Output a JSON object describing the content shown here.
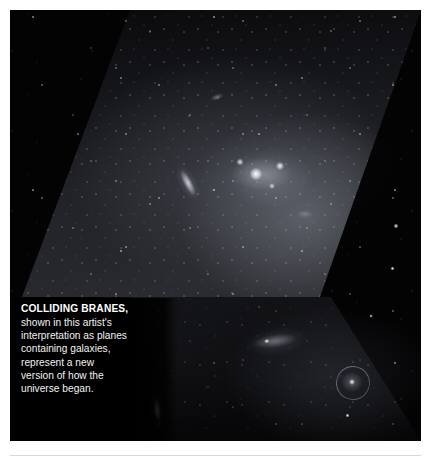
{
  "figure": {
    "alt_description": "Artist's rendering of two colliding branes depicted as star-filled planes containing galaxies",
    "background_color": "#000000",
    "page_background": "#ffffff",
    "caption": {
      "headline": "COLLIDING BRANES,",
      "body_lines": [
        "shown in this artist's",
        "interpretation as planes",
        "containing galaxies,",
        "represent a new",
        "version of how the",
        "universe began."
      ],
      "text_color": "#ffffff"
    },
    "objects": [
      {
        "name": "bright-star-cluster",
        "label": "bright star cluster"
      },
      {
        "name": "edge-on-galaxy-upper",
        "label": "edge-on galaxy"
      },
      {
        "name": "spiral-galaxy",
        "label": "face-on spiral galaxy"
      },
      {
        "name": "elliptical-galaxy",
        "label": "elliptical galaxy"
      },
      {
        "name": "diffuse-galaxy",
        "label": "diffuse edge-on galaxy"
      }
    ]
  }
}
